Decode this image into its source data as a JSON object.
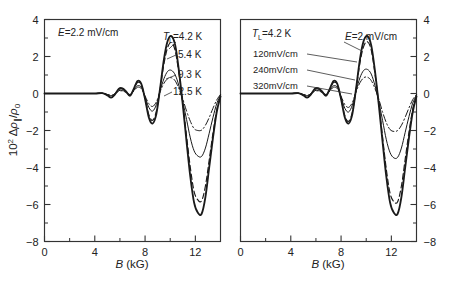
{
  "figure": {
    "panels": [
      {
        "id": "left",
        "condition_label": "E=2.2 mV/cm",
        "condition_label_italic_lead": "E",
        "condition_label_rest": "=2.2 mV/cm",
        "legend_title": "T",
        "legend_title_sub": "L",
        "legend_items": [
          {
            "label": "=4.2 K",
            "style": "solid-thick"
          },
          {
            "label": "5.4 K",
            "style": "dashed"
          },
          {
            "label": "9.3 K",
            "style": "thin"
          },
          {
            "label": "12.5 K",
            "style": "dashdot"
          }
        ],
        "xlabel_italic": "B",
        "xlabel_rest": " (kG)",
        "ylabel": "10² Δρ∥/ρ₀",
        "xticks": [
          "0",
          "4",
          "8",
          "12"
        ],
        "yticks": [
          "4",
          "2",
          "0",
          "−2",
          "−4",
          "−6",
          "−8"
        ],
        "y_axis_side": "left"
      },
      {
        "id": "right",
        "condition_label": "T_L=4.2 K",
        "condition_label_italic_lead": "T",
        "condition_label_sub": "L",
        "condition_label_rest": "=4.2 K",
        "legend_items": [
          {
            "label": "=2 mV/cm",
            "italic_lead": "E",
            "style": "solid-thick"
          },
          {
            "label": "120mV/cm",
            "style": "dashed"
          },
          {
            "label": "240mV/cm",
            "style": "thin"
          },
          {
            "label": "320mV/cm",
            "style": "dashdot"
          }
        ],
        "xlabel_italic": "B",
        "xlabel_rest": " (kG)",
        "xticks": [
          "0",
          "4",
          "8",
          "12"
        ],
        "yticks": [
          "4",
          "2",
          "0",
          "−2",
          "−4",
          "−6",
          "−8"
        ],
        "y_axis_side": "right"
      }
    ]
  },
  "chart_data": [
    {
      "type": "line",
      "panel": "left",
      "title": "",
      "xlabel": "B (kG)",
      "ylabel": "10^2 Δρ∥/ρ₀",
      "xlim": [
        0,
        14
      ],
      "ylim": [
        -8,
        4
      ],
      "xticks": [
        0,
        4,
        8,
        12
      ],
      "xticks_minor": [
        2,
        6,
        10,
        14
      ],
      "yticks": [
        4,
        2,
        0,
        -2,
        -4,
        -6,
        -8
      ],
      "yticks_minor": [
        3,
        1,
        -1,
        -3,
        -5,
        -7
      ],
      "grid": false,
      "legend_position": "upper-right-inside",
      "annotations": [
        "E=2.2 mV/cm",
        "T_L=4.2 K"
      ],
      "series": [
        {
          "name": "4.2 K",
          "style": "solid-thick",
          "x": [
            0,
            1,
            2,
            3,
            4,
            4.6,
            5.0,
            5.3,
            5.6,
            5.9,
            6.2,
            6.5,
            6.8,
            7.1,
            7.4,
            7.7,
            8.0,
            8.3,
            8.6,
            8.9,
            9.2,
            9.5,
            9.8,
            10.1,
            10.4,
            10.7,
            11.0,
            11.3,
            11.6,
            11.9,
            12.2,
            12.5,
            12.8,
            13.1,
            13.4,
            13.7,
            14.0
          ],
          "y": [
            0,
            0,
            0,
            0,
            0,
            0.02,
            -0.1,
            -0.22,
            -0.05,
            0.25,
            0.28,
            0.1,
            -0.12,
            0.25,
            0.68,
            0.52,
            -0.3,
            -1.3,
            -1.62,
            -1.1,
            0.3,
            1.85,
            2.85,
            3.1,
            2.6,
            1.2,
            -0.6,
            -2.6,
            -4.5,
            -5.9,
            -6.45,
            -6.5,
            -5.6,
            -4.0,
            -2.4,
            -1.0,
            -0.15
          ]
        },
        {
          "name": "5.4 K",
          "style": "dashed",
          "x": [
            0,
            1,
            2,
            3,
            4,
            4.6,
            5.0,
            5.3,
            5.6,
            5.9,
            6.2,
            6.5,
            6.8,
            7.1,
            7.4,
            7.7,
            8.0,
            8.3,
            8.6,
            8.9,
            9.2,
            9.5,
            9.8,
            10.1,
            10.4,
            10.7,
            11.0,
            11.3,
            11.6,
            11.9,
            12.2,
            12.5,
            12.8,
            13.1,
            13.4,
            13.7,
            14.0
          ],
          "y": [
            0,
            0,
            0,
            0,
            0,
            0.02,
            -0.08,
            -0.2,
            -0.04,
            0.22,
            0.25,
            0.09,
            -0.1,
            0.22,
            0.6,
            0.46,
            -0.26,
            -1.15,
            -1.45,
            -0.95,
            0.25,
            1.6,
            2.5,
            2.75,
            2.3,
            1.05,
            -0.5,
            -2.3,
            -4.0,
            -5.3,
            -5.75,
            -5.8,
            -5.0,
            -3.6,
            -2.15,
            -0.9,
            -0.12
          ]
        },
        {
          "name": "9.3 K",
          "style": "thin",
          "x": [
            0,
            1,
            2,
            3,
            4,
            4.6,
            5.0,
            5.3,
            5.6,
            5.9,
            6.2,
            6.5,
            6.8,
            7.1,
            7.4,
            7.7,
            8.0,
            8.3,
            8.6,
            8.9,
            9.2,
            9.5,
            9.8,
            10.1,
            10.4,
            10.7,
            11.0,
            11.3,
            11.6,
            11.9,
            12.2,
            12.5,
            12.8,
            13.1,
            13.4,
            13.7,
            14.0
          ],
          "y": [
            0,
            0,
            0,
            0,
            0,
            0.01,
            -0.05,
            -0.12,
            -0.02,
            0.15,
            0.17,
            0.06,
            -0.07,
            0.16,
            0.42,
            0.33,
            -0.18,
            -0.75,
            -0.95,
            -0.6,
            0.15,
            0.8,
            1.2,
            1.25,
            1.0,
            0.4,
            -0.45,
            -1.4,
            -2.4,
            -3.1,
            -3.38,
            -3.4,
            -2.95,
            -2.15,
            -1.3,
            -0.55,
            -0.08
          ]
        },
        {
          "name": "12.5 K",
          "style": "dashdot",
          "x": [
            0,
            1,
            2,
            3,
            4,
            4.6,
            5.0,
            5.3,
            5.6,
            5.9,
            6.2,
            6.5,
            6.8,
            7.1,
            7.4,
            7.7,
            8.0,
            8.3,
            8.6,
            8.9,
            9.2,
            9.5,
            9.8,
            10.1,
            10.4,
            10.7,
            11.0,
            11.3,
            11.6,
            11.9,
            12.2,
            12.5,
            12.8,
            13.1,
            13.4,
            13.7,
            14.0
          ],
          "y": [
            0,
            0,
            0,
            0,
            0,
            0.01,
            -0.04,
            -0.1,
            -0.02,
            0.12,
            0.14,
            0.05,
            -0.05,
            0.13,
            0.34,
            0.26,
            -0.14,
            -0.55,
            -0.7,
            -0.45,
            0.1,
            0.55,
            0.8,
            0.85,
            0.68,
            0.25,
            -0.3,
            -0.95,
            -1.5,
            -1.9,
            -2.0,
            -1.98,
            -1.72,
            -1.3,
            -0.8,
            -0.35,
            -0.05
          ]
        }
      ]
    },
    {
      "type": "line",
      "panel": "right",
      "title": "",
      "xlabel": "B (kG)",
      "ylabel": "",
      "xlim": [
        0,
        14
      ],
      "ylim": [
        -8,
        4
      ],
      "xticks": [
        0,
        4,
        8,
        12
      ],
      "xticks_minor": [
        2,
        6,
        10,
        14
      ],
      "yticks": [
        4,
        2,
        0,
        -2,
        -4,
        -6,
        -8
      ],
      "yticks_minor": [
        3,
        1,
        -1,
        -3,
        -5,
        -7
      ],
      "grid": false,
      "legend_position": "upper-left-inside",
      "annotations": [
        "T_L=4.2 K",
        "E=2 mV/cm"
      ],
      "series": [
        {
          "name": "2 mV/cm",
          "style": "solid-thick",
          "x": [
            0,
            1,
            2,
            3,
            4,
            4.6,
            5.0,
            5.3,
            5.6,
            5.9,
            6.2,
            6.5,
            6.8,
            7.1,
            7.4,
            7.7,
            8.0,
            8.3,
            8.6,
            8.9,
            9.2,
            9.5,
            9.8,
            10.1,
            10.4,
            10.7,
            11.0,
            11.3,
            11.6,
            11.9,
            12.2,
            12.5,
            12.8,
            13.1,
            13.4,
            13.7,
            14.0
          ],
          "y": [
            0,
            0,
            0,
            0,
            0,
            0.02,
            -0.1,
            -0.22,
            -0.05,
            0.25,
            0.28,
            0.1,
            -0.12,
            0.25,
            0.68,
            0.52,
            -0.3,
            -1.3,
            -1.62,
            -1.1,
            0.3,
            1.85,
            2.85,
            3.1,
            2.6,
            1.2,
            -0.6,
            -2.6,
            -4.5,
            -5.9,
            -6.45,
            -6.5,
            -5.6,
            -4.0,
            -2.4,
            -1.0,
            -0.15
          ]
        },
        {
          "name": "120mV/cm",
          "style": "dashed",
          "x": [
            0,
            1,
            2,
            3,
            4,
            4.6,
            5.0,
            5.3,
            5.6,
            5.9,
            6.2,
            6.5,
            6.8,
            7.1,
            7.4,
            7.7,
            8.0,
            8.3,
            8.6,
            8.9,
            9.2,
            9.5,
            9.8,
            10.1,
            10.4,
            10.7,
            11.0,
            11.3,
            11.6,
            11.9,
            12.2,
            12.5,
            12.8,
            13.1,
            13.4,
            13.7,
            14.0
          ],
          "y": [
            0,
            0,
            0,
            0,
            0,
            0.02,
            -0.08,
            -0.2,
            -0.04,
            0.22,
            0.25,
            0.09,
            -0.1,
            0.22,
            0.6,
            0.46,
            -0.28,
            -1.2,
            -1.5,
            -1.0,
            0.25,
            1.65,
            2.55,
            2.8,
            2.35,
            1.05,
            -0.55,
            -2.35,
            -4.1,
            -5.4,
            -5.85,
            -5.85,
            -5.0,
            -3.55,
            -2.1,
            -0.85,
            -0.12
          ]
        },
        {
          "name": "240mV/cm",
          "style": "thin",
          "x": [
            0,
            1,
            2,
            3,
            4,
            4.6,
            5.0,
            5.3,
            5.6,
            5.9,
            6.2,
            6.5,
            6.8,
            7.1,
            7.4,
            7.7,
            8.0,
            8.3,
            8.6,
            8.9,
            9.2,
            9.5,
            9.8,
            10.1,
            10.4,
            10.7,
            11.0,
            11.3,
            11.6,
            11.9,
            12.2,
            12.5,
            12.8,
            13.1,
            13.4,
            13.7,
            14.0
          ],
          "y": [
            0,
            0,
            0,
            0,
            0,
            0.01,
            -0.05,
            -0.12,
            -0.02,
            0.15,
            0.17,
            0.06,
            -0.07,
            0.16,
            0.42,
            0.33,
            -0.2,
            -0.8,
            -1.0,
            -0.62,
            0.15,
            0.85,
            1.25,
            1.3,
            1.05,
            0.42,
            -0.45,
            -1.45,
            -2.5,
            -3.2,
            -3.48,
            -3.45,
            -2.95,
            -2.1,
            -1.25,
            -0.52,
            -0.08
          ]
        },
        {
          "name": "320mV/cm",
          "style": "dashdot",
          "x": [
            0,
            1,
            2,
            3,
            4,
            4.6,
            5.0,
            5.3,
            5.6,
            5.9,
            6.2,
            6.5,
            6.8,
            7.1,
            7.4,
            7.7,
            8.0,
            8.3,
            8.6,
            8.9,
            9.2,
            9.5,
            9.8,
            10.1,
            10.4,
            10.7,
            11.0,
            11.3,
            11.6,
            11.9,
            12.2,
            12.5,
            12.8,
            13.1,
            13.4,
            13.7,
            14.0
          ],
          "y": [
            0,
            0,
            0,
            0,
            0,
            0.01,
            -0.04,
            -0.1,
            -0.02,
            0.12,
            0.14,
            0.05,
            -0.05,
            0.13,
            0.34,
            0.26,
            -0.15,
            -0.6,
            -0.75,
            -0.48,
            0.1,
            0.58,
            0.85,
            0.88,
            0.7,
            0.26,
            -0.3,
            -1.0,
            -1.58,
            -1.95,
            -2.05,
            -2.0,
            -1.72,
            -1.28,
            -0.78,
            -0.33,
            -0.05
          ]
        }
      ]
    }
  ]
}
